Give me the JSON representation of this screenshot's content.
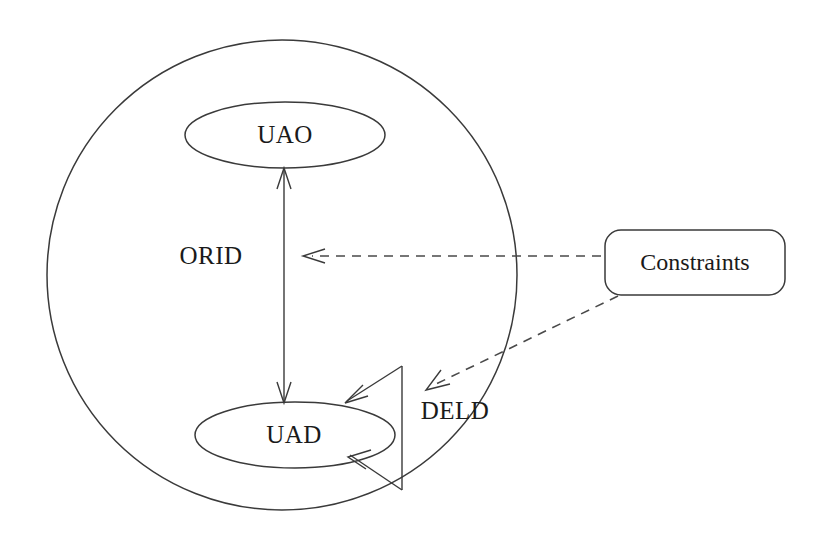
{
  "diagram": {
    "background_color": "#ffffff",
    "stroke_color": "#3a3a3a",
    "text_color": "#1a1a1a",
    "nodes": {
      "outer_circle": {
        "label": "ORID",
        "shape": "circle",
        "cx": 282,
        "cy": 275,
        "r": 235
      },
      "uao": {
        "label": "UAO",
        "shape": "ellipse",
        "cx": 285,
        "cy": 135,
        "rx": 100,
        "ry": 33
      },
      "uad": {
        "label": "UAD",
        "shape": "ellipse",
        "cx": 295,
        "cy": 435,
        "rx": 100,
        "ry": 33
      },
      "deld": {
        "label": "DELD",
        "shape": "self-loop-triangle",
        "x": 455,
        "y": 412
      },
      "constraints": {
        "label": "Constraints",
        "shape": "rounded-rectangle",
        "x": 605,
        "y": 230,
        "width": 180,
        "height": 65
      }
    },
    "edges": [
      {
        "name": "uao-uad-bidirectional",
        "from": "UAD",
        "to": "UAO",
        "style": "solid",
        "arrows": "both"
      },
      {
        "name": "constraints-to-orid",
        "from": "Constraints",
        "to": "ORID",
        "style": "dashed",
        "arrows": "single"
      },
      {
        "name": "constraints-to-deld",
        "from": "Constraints",
        "to": "DELD",
        "style": "dashed",
        "arrows": "single"
      },
      {
        "name": "deld-self-loop",
        "from": "UAD",
        "to": "UAD",
        "style": "solid",
        "arrows": "both"
      }
    ]
  }
}
